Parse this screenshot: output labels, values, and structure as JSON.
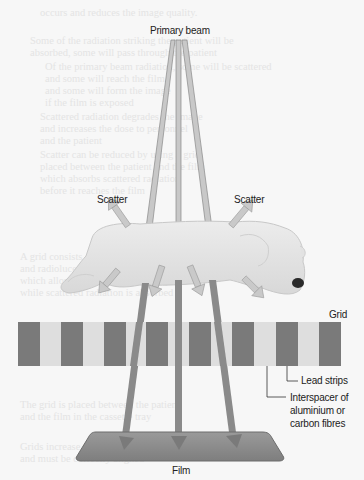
{
  "diagram": {
    "title_label": "Primary beam",
    "scatter_left": "Scatter",
    "scatter_right": "Scatter",
    "grid_label": "Grid",
    "lead_strips_label": "Lead strips",
    "interspacer_label": [
      "Interspacer of",
      "aluminium or",
      "carbon fibres"
    ],
    "film_label": "Film",
    "colors": {
      "beam": "#8a8a8a",
      "beam_top": "#c8c8c8",
      "scatter_arrow": "#c9c9c9",
      "lead_strip": "#7a7a7a",
      "interspacer": "#dedede",
      "film": "#8f8f8f",
      "dog_body": "#e6e6e6",
      "background": "#f7f7f7"
    },
    "grid_strip_count": 8
  }
}
